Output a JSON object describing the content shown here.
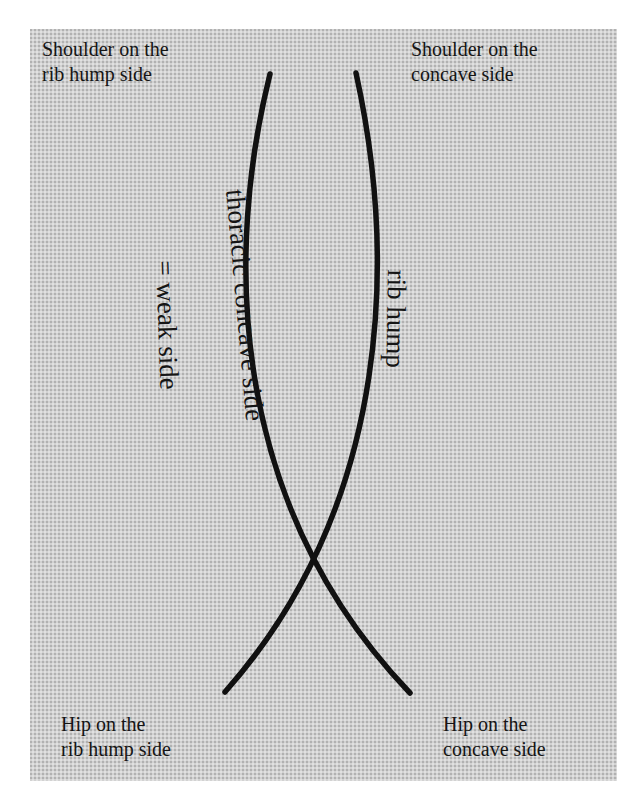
{
  "diagram": {
    "labels": {
      "top_left": {
        "line1": "Shoulder on the",
        "line2": "rib hump side"
      },
      "top_right": {
        "line1": "Shoulder on the",
        "line2": "concave side"
      },
      "bottom_left": {
        "line1": "Hip on the",
        "line2": "rib hump side"
      },
      "bottom_right": {
        "line1": "Hip on the",
        "line2": "concave side"
      }
    },
    "curve_labels": {
      "right_inner": "rib hump",
      "left_outer_line1": "thoracic concave side",
      "left_outer_line2": "= weak side"
    },
    "colors": {
      "background": "#d2d2d2",
      "stroke": "#111111",
      "text": "#151515"
    }
  }
}
